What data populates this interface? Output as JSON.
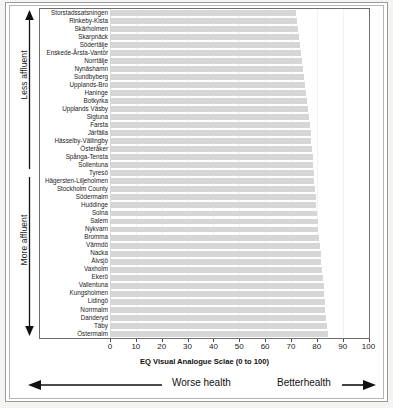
{
  "axes": {
    "affluence_top_label": "Less affluent",
    "affluence_bottom_label": "More affluent",
    "x_title": "EQ Visual Analogue Sclae (0 to 100)",
    "worse_health_label": "Worse health",
    "better_health_label": "Betterhealth"
  },
  "chart_data": {
    "type": "bar",
    "orientation": "horizontal",
    "title": "",
    "xlabel": "EQ Visual Analogue Sclae (0 to 100)",
    "ylabel": "",
    "xlim": [
      0,
      100
    ],
    "xticks": [
      0,
      10,
      20,
      30,
      40,
      50,
      60,
      70,
      80,
      90,
      100
    ],
    "grid": true,
    "legend": false,
    "bar_color": "#d6d6d6",
    "annotations": [
      "Less affluent (upward arrow, top half of y-axis)",
      "More affluent (downward arrow, bottom half of y-axis)",
      "Worse health (leftward arrow below x-axis)",
      "Betterhealth (rightward arrow below x-axis)"
    ],
    "categories": [
      "Storstadssatsningen",
      "Rinkeby-Kista",
      "Skärholmen",
      "Skarpnäck",
      "Södertälje",
      "Enskede-Årsta-Vantör",
      "Norrtälje",
      "Nynäshamn",
      "Sundbyberg",
      "Upplands-Bro",
      "Haninge",
      "Botkyrka",
      "Upplands Väsby",
      "Sigtuna",
      "Farsta",
      "Järfälla",
      "Hässelby-Vällingby",
      "Österåker",
      "Spånga-Tensta",
      "Sollentuna",
      "Tyresö",
      "Hägersten-Liljeholmen",
      "Stockholm County",
      "Södermalm",
      "Huddinge",
      "Solna",
      "Salem",
      "Nykvarn",
      "Bromma",
      "Värmdö",
      "Nacka",
      "Älvsjö",
      "Vaxholm",
      "Ekerö",
      "Vallentuna",
      "Kungsholmen",
      "Lidingö",
      "Norrmalm",
      "Danderyd",
      "Täby",
      "Östermalm"
    ],
    "values": [
      72.0,
      72.4,
      72.8,
      73.2,
      73.6,
      74.0,
      74.4,
      74.8,
      75.2,
      75.6,
      76.0,
      76.4,
      76.7,
      77.0,
      77.3,
      77.6,
      77.9,
      78.2,
      78.4,
      78.6,
      78.8,
      79.0,
      79.2,
      79.5,
      79.8,
      80.0,
      80.3,
      80.6,
      80.9,
      81.2,
      81.5,
      81.8,
      82.1,
      82.4,
      82.6,
      82.8,
      83.0,
      83.3,
      83.6,
      83.9,
      84.2
    ]
  }
}
